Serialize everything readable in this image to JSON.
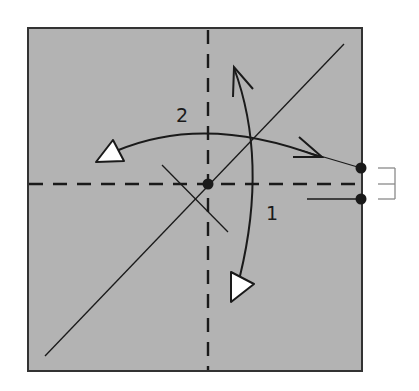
{
  "diagram": {
    "type": "origami-fold-instruction",
    "colors": {
      "paper": "#b3b3b3",
      "line": "#1a1a1a",
      "arrowhead_fill": "#ffffff",
      "bracket": "#8a8a8a",
      "background": "#ffffff"
    },
    "paper_square": {
      "x": 28,
      "y": 28,
      "width": 334,
      "height": 343
    },
    "creases": [
      {
        "name": "vertical-valley-fold",
        "style": "dashed",
        "x1": 208,
        "y1": 30,
        "x2": 208,
        "y2": 370
      },
      {
        "name": "horizontal-valley-fold",
        "style": "dashed",
        "x1": 29,
        "y1": 184,
        "x2": 358,
        "y2": 184
      },
      {
        "name": "diagonal-crease",
        "style": "solid",
        "x1": 45,
        "y1": 356,
        "x2": 344,
        "y2": 44
      },
      {
        "name": "short-perpendicular-crease",
        "style": "solid",
        "x1": 162,
        "y1": 165,
        "x2": 228,
        "y2": 232
      },
      {
        "name": "right-guide-line-upper",
        "style": "solid",
        "x1": 300,
        "y1": 150,
        "x2": 361,
        "y2": 168
      },
      {
        "name": "right-guide-line-lower",
        "style": "solid",
        "x1": 307,
        "y1": 199,
        "x2": 361,
        "y2": 199
      }
    ],
    "points": [
      {
        "name": "center-point",
        "cx": 208,
        "cy": 184
      },
      {
        "name": "edge-point-upper",
        "cx": 361,
        "cy": 168
      },
      {
        "name": "edge-point-lower",
        "cx": 361,
        "cy": 199
      }
    ],
    "step_labels": [
      {
        "name": "step-1-label",
        "text": "1",
        "x": 266,
        "y": 220
      },
      {
        "name": "step-2-label",
        "text": "2",
        "x": 176,
        "y": 122
      }
    ],
    "equal_spacing_bracket": {
      "x1": 378,
      "x2": 395,
      "y_top": 168,
      "y_mid": 184,
      "y_bottom": 199
    }
  }
}
